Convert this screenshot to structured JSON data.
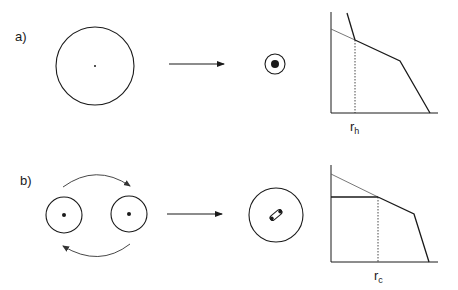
{
  "panels": [
    {
      "id": "a",
      "label": "a)",
      "description": "single large body collapses into compact core",
      "chart": {
        "marker_label": "r",
        "marker_subscript": "h"
      }
    },
    {
      "id": "b",
      "label": "b)",
      "description": "orbiting binary pair collapses into tight binary",
      "chart": {
        "marker_label": "r",
        "marker_subscript": "c"
      }
    }
  ],
  "colors": {
    "stroke": "#1a1a1a",
    "thin_stroke": "#555555",
    "background": "#ffffff"
  }
}
